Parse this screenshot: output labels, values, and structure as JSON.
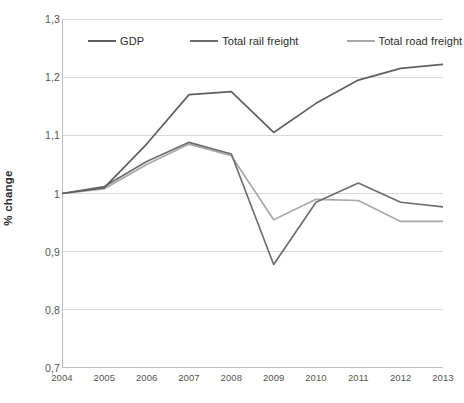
{
  "chart_data": {
    "type": "line",
    "title": "",
    "subtitle": "",
    "xlabel": "",
    "ylabel": "% change",
    "categories": [
      "2004",
      "2005",
      "2006",
      "2007",
      "2008",
      "2009",
      "2010",
      "2011",
      "2012",
      "2013"
    ],
    "x": [
      2004,
      2005,
      2006,
      2007,
      2008,
      2009,
      2010,
      2011,
      2012,
      2013
    ],
    "ylim": [
      0.7,
      1.3
    ],
    "ytick_labels": [
      "0,7",
      "0,8",
      "0,9",
      "1",
      "1,1",
      "1,2",
      "1,3"
    ],
    "ytick_values": [
      0.7,
      0.8,
      0.9,
      1.0,
      1.1,
      1.2,
      1.3
    ],
    "grid": true,
    "grid_axis": "y",
    "legend_position": "top-inside",
    "decimal_separator": ",",
    "series": [
      {
        "name": "GDP",
        "color": "#5f5f5f",
        "values": [
          1.0,
          1.01,
          1.085,
          1.17,
          1.175,
          1.105,
          1.155,
          1.195,
          1.215,
          1.222
        ]
      },
      {
        "name": "Total rail freight",
        "color": "#6e6e6e",
        "values": [
          1.0,
          1.012,
          1.055,
          1.088,
          1.068,
          0.878,
          0.985,
          1.018,
          0.985,
          0.977
        ]
      },
      {
        "name": "Total road freight",
        "color": "#a8a8a8",
        "values": [
          1.0,
          1.008,
          1.05,
          1.085,
          1.065,
          0.955,
          0.99,
          0.988,
          0.952,
          0.952
        ]
      }
    ]
  },
  "colors": {
    "background": "#ffffff",
    "gridline": "#d9d9d9",
    "axis": "#bfbfbf",
    "tick_text": "#555555",
    "axis_label_text": "#2b2b2b"
  },
  "caption": {
    "text": ""
  }
}
